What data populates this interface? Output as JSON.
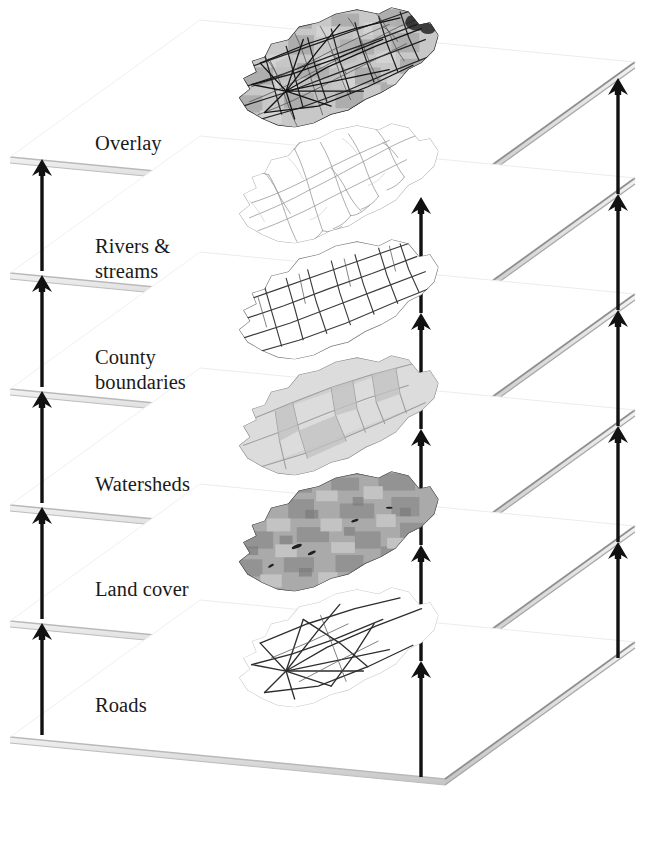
{
  "diagram": {
    "type": "layer-stack",
    "layer_count": 6,
    "colors": {
      "plane_top": "#ffffff",
      "plane_edge": "#b9b9b9",
      "plane_edge_dark": "#8f8f8f",
      "plane_thickness": "#d8d8d8",
      "arrow": "#111111",
      "label_text": "#1a1a1a",
      "background": "#ffffff",
      "map_dark": "#3a3a3a",
      "map_mid": "#8a8a8a",
      "map_light": "#c9c9c9"
    },
    "layers": [
      {
        "index": 0,
        "label": "Overlay",
        "label_lines": [
          "Overlay"
        ],
        "map_style": "composite",
        "description": "All themes combined - dense dark network over shaded base",
        "y": 157
      },
      {
        "index": 1,
        "label": "Rivers & streams",
        "label_lines": [
          "Rivers &",
          "streams"
        ],
        "map_style": "streams",
        "description": "Fine dendritic light-gray stream network",
        "y": 273
      },
      {
        "index": 2,
        "label": "County boundaries",
        "label_lines": [
          "County",
          "boundaries"
        ],
        "map_style": "counties",
        "description": "Angular polygon grid of county outlines",
        "y": 389
      },
      {
        "index": 3,
        "label": "Watersheds",
        "label_lines": [
          "Watersheds"
        ],
        "map_style": "watersheds",
        "description": "Light gray filled watershed polygons",
        "y": 505
      },
      {
        "index": 4,
        "label": "Land cover",
        "label_lines": [
          "Land cover"
        ],
        "map_style": "landcover",
        "description": "Dark mottled raster land cover texture",
        "y": 621
      },
      {
        "index": 5,
        "label": "Roads",
        "label_lines": [
          "Roads"
        ],
        "map_style": "roads",
        "description": "Sparse radiating road line network",
        "y": 737
      }
    ],
    "arrow_columns": [
      {
        "name": "left",
        "x": 42,
        "count": 5
      },
      {
        "name": "middle",
        "x": 421,
        "count": 5
      },
      {
        "name": "right",
        "x": 618,
        "count": 5
      }
    ],
    "label_positions": [
      {
        "x": 95,
        "y": 131
      },
      {
        "x": 95,
        "y": 234
      },
      {
        "x": 95,
        "y": 345
      },
      {
        "x": 95,
        "y": 472
      },
      {
        "x": 95,
        "y": 577
      },
      {
        "x": 95,
        "y": 693
      }
    ]
  }
}
